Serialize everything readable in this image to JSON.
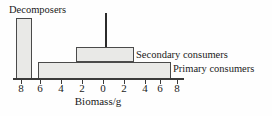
{
  "chart_data": {
    "type": "bar",
    "orientation": "horizontal-pyramid",
    "title": "",
    "xlabel": "Biomass/g",
    "ylabel": "",
    "grid": false,
    "legend_position": "inline-right",
    "axis": {
      "tick_labels": [
        "8",
        "6",
        "4",
        "2",
        "0",
        "2",
        "4",
        "6",
        "8"
      ],
      "tick_values": [
        -8,
        -6,
        -4,
        -2,
        0,
        2,
        4,
        6,
        8
      ],
      "xlim": [
        -8.8,
        8.8
      ],
      "note": "Axis is symmetric about 0; bars are centred on 0 so half-widths are read on each side"
    },
    "categories": [
      "Decomposers",
      "Secondary consumers",
      "Primary consumers",
      "Tertiary consumers"
    ],
    "bars": [
      {
        "name": "Decomposers",
        "label": "Decomposers",
        "left_value": -8.6,
        "right_value": -7.0,
        "width": 1.6,
        "centred": false,
        "fill": "#e9e9e7",
        "stroke": "#4a4a4a"
      },
      {
        "name": "Secondary consumers",
        "label": "Secondary consumers",
        "left_value": -2.3,
        "right_value": 2.7,
        "width": 5.0,
        "centred": true,
        "fill": "#e9e9e7",
        "stroke": "#4a4a4a"
      },
      {
        "name": "Primary consumers",
        "label": "Primary consumers",
        "left_value": -7.0,
        "right_value": 7.3,
        "width": 14.3,
        "centred": true,
        "fill": "#e9e9e7",
        "stroke": "#4a4a4a"
      },
      {
        "name": "Tertiary consumers",
        "label": "",
        "left_value": 0,
        "right_value": 0,
        "width": 0.15,
        "centred": true,
        "fill": "#2b2b2b",
        "stroke": "#2b2b2b"
      }
    ],
    "colors": {
      "bar_fill": "#e9e9e7",
      "bar_stroke": "#4a4a4a",
      "axis": "#3a3a3a",
      "text": "#1a1a1a",
      "background": "#fefefe"
    }
  },
  "labels": {
    "decomposers": "Decomposers",
    "secondary_consumers": "Secondary consumers",
    "primary_consumers": "Primary consumers",
    "axis_title": "Biomass/g"
  },
  "ticks": [
    {
      "label": "8",
      "x": 21
    },
    {
      "label": "6",
      "x": 40
    },
    {
      "label": "4",
      "x": 61
    },
    {
      "label": "2",
      "x": 82
    },
    {
      "label": "0",
      "x": 103
    },
    {
      "label": "2",
      "x": 124
    },
    {
      "label": "4",
      "x": 145
    },
    {
      "label": "6",
      "x": 160
    },
    {
      "label": "8",
      "x": 177
    }
  ]
}
